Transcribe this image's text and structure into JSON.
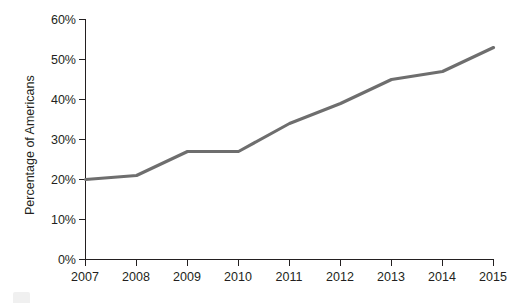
{
  "chart_data": {
    "type": "line",
    "title": "",
    "xlabel": "",
    "ylabel": "Percentage of Americans",
    "categories": [
      "2007",
      "2008",
      "2009",
      "2010",
      "2011",
      "2012",
      "2013",
      "2014",
      "2015"
    ],
    "x": [
      2007,
      2008,
      2009,
      2010,
      2011,
      2012,
      2013,
      2014,
      2015
    ],
    "values": [
      20,
      21,
      27,
      27,
      34,
      39,
      45,
      47,
      53
    ],
    "series": [
      {
        "name": "Percentage of Americans",
        "values": [
          20,
          21,
          27,
          27,
          34,
          39,
          45,
          47,
          53
        ]
      }
    ],
    "ylim": [
      0,
      60
    ],
    "ytick_labels": [
      "0%",
      "10%",
      "20%",
      "30%",
      "40%",
      "50%",
      "60%"
    ],
    "ytick_values": [
      0,
      10,
      20,
      30,
      40,
      50,
      60
    ],
    "xtick_labels": [
      "2007",
      "2008",
      "2009",
      "2010",
      "2011",
      "2012",
      "2013",
      "2014",
      "2015"
    ],
    "grid": false,
    "legend": "none",
    "line_color": "#6e6e6e",
    "axis_color": "#231f20",
    "background_color": "#ffffff"
  },
  "axes": {
    "y_axis_title": "Percentage of Americans"
  }
}
